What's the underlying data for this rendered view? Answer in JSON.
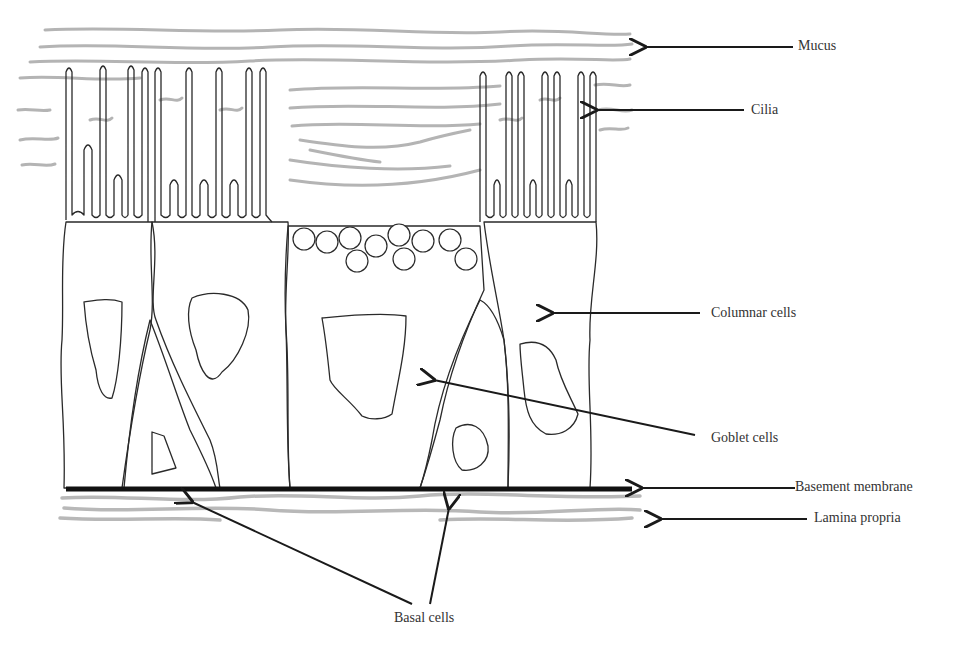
{
  "diagram": {
    "labels": {
      "mucus": "Mucus",
      "cilia": "Cilia",
      "columnar_cells": "Columnar cells",
      "goblet_cells": "Goblet cells",
      "basement_membrane": "Basement membrane",
      "lamina_propria": "Lamina propria",
      "basal_cells": "Basal cells"
    },
    "colors": {
      "line": "#2a2a2a",
      "mucus": "#b4b4b4",
      "basement": "#111111",
      "text": "#333333",
      "background": "#ffffff"
    }
  }
}
